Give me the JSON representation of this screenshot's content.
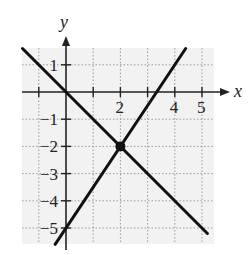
{
  "chart_data": {
    "type": "line",
    "title": "",
    "xlabel": "x",
    "ylabel": "y",
    "xlim": [
      -1.7,
      5.5
    ],
    "ylim": [
      -5.6,
      1.7
    ],
    "grid": true,
    "x_tick_labels": [
      "2",
      "4",
      "5"
    ],
    "y_tick_labels": [
      "1",
      "-1",
      "-2",
      "-3",
      "-4",
      "-5"
    ],
    "series": [
      {
        "name": "y = -x",
        "slope": -1,
        "intercept": 0,
        "x": [
          -1.6,
          5.2
        ],
        "y": [
          1.6,
          -5.2
        ]
      },
      {
        "name": "y = 1.5x - 5",
        "slope": 1.5,
        "intercept": -5,
        "x": [
          -0.4,
          4.4
        ],
        "y": [
          -5.6,
          1.6
        ]
      }
    ],
    "points": [
      {
        "x": 2,
        "y": -2,
        "label": "intersection"
      }
    ]
  },
  "labels": {
    "x_axis": "x",
    "y_axis": "y",
    "xticks": [
      {
        "v": 2,
        "t": "2"
      },
      {
        "v": 4,
        "t": "4"
      },
      {
        "v": 5,
        "t": "5"
      }
    ],
    "yticks": [
      {
        "v": 1,
        "t": "1"
      },
      {
        "v": -1,
        "t": "−1"
      },
      {
        "v": -2,
        "t": "−2"
      },
      {
        "v": -3,
        "t": "−3"
      },
      {
        "v": -4,
        "t": "−4"
      },
      {
        "v": -5,
        "t": "−5"
      }
    ]
  },
  "colors": {
    "line": "#111111",
    "grid": "#9a9a9a",
    "plot_bg": "#f2f2f2",
    "axis": "#222222"
  }
}
